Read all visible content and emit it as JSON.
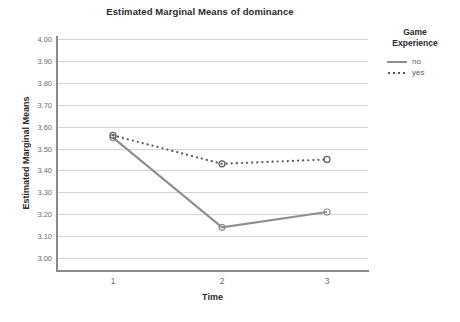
{
  "chart_data": {
    "type": "line",
    "title": "Estimated Marginal Means of dominance",
    "xlabel": "Time",
    "ylabel": "Estimated Marginal Means",
    "x": [
      1,
      2,
      3
    ],
    "xtick_labels": [
      "1",
      "2",
      "3"
    ],
    "ylim": [
      3.0,
      4.0
    ],
    "ytick_labels": [
      "4.00",
      "3.90",
      "3.80",
      "3.70",
      "3.60",
      "3.50",
      "3.40",
      "3.30",
      "3.20",
      "3.10",
      "3.00"
    ],
    "ytick_values": [
      4.0,
      3.9,
      3.8,
      3.7,
      3.6,
      3.5,
      3.4,
      3.3,
      3.2,
      3.1,
      3.0
    ],
    "grid": true,
    "legend_position": "right",
    "legend_title": "Game Experience",
    "series": [
      {
        "name": "no",
        "style": "solid",
        "color": "#8f8f8f",
        "values": [
          3.55,
          3.14,
          3.21
        ]
      },
      {
        "name": "yes",
        "style": "dotted",
        "color": "#5a5a5a",
        "values": [
          3.56,
          3.43,
          3.45
        ]
      }
    ]
  },
  "legend": {
    "title_line1": "Game",
    "title_line2": "Experience",
    "entries": [
      {
        "label": "no"
      },
      {
        "label": "yes"
      }
    ]
  },
  "colors": {
    "axis": "#8a8a8a",
    "grid": "#d4d4d4",
    "text": "#2b2b2b",
    "tick_text": "#6d6d6d",
    "series_no": "#8f8f8f",
    "series_yes": "#5a5a5a"
  }
}
